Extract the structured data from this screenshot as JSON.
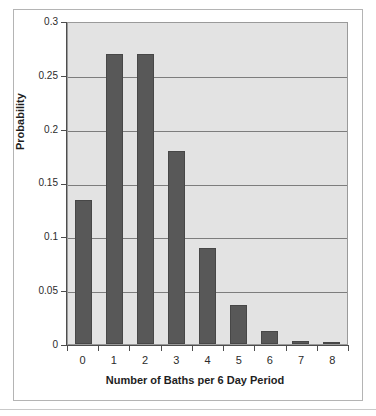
{
  "chart_data": {
    "type": "bar",
    "title": "",
    "xlabel": "Number of Baths per 6 Day Period",
    "ylabel": "Probability",
    "categories": [
      "0",
      "1",
      "2",
      "3",
      "4",
      "5",
      "6",
      "7",
      "8"
    ],
    "values": [
      0.135,
      0.271,
      0.271,
      0.18,
      0.09,
      0.036,
      0.012,
      0.003,
      0.001
    ],
    "series": [
      {
        "name": "Probability",
        "values": [
          0.135,
          0.271,
          0.271,
          0.18,
          0.09,
          0.036,
          0.012,
          0.003,
          0.001
        ]
      }
    ],
    "ylim": [
      0,
      0.3
    ],
    "ytick_labels": [
      "0.3",
      "0.25",
      "0.2",
      "0.15",
      "0.1",
      "0.05",
      "0"
    ],
    "ytick_values": [
      0.3,
      0.25,
      0.2,
      0.15,
      0.1,
      0.05,
      0
    ],
    "grid": true,
    "legend": false,
    "legend_position": "none",
    "bar_color": "#585858",
    "plot_background": "#e3e3e3",
    "gridline_color": "#7d7d7d",
    "axis_color": "#4d4d4d"
  }
}
